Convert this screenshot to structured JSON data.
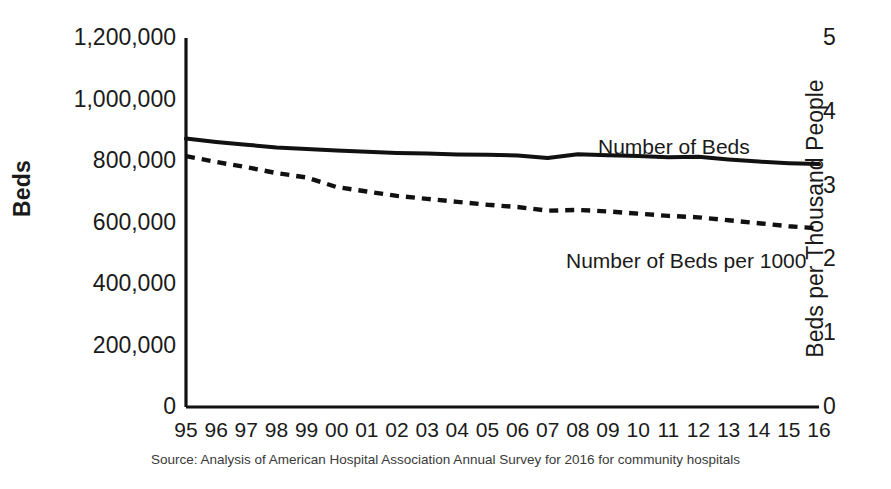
{
  "chart_data": {
    "type": "line",
    "title": "",
    "subtitle": "",
    "xlabel": "",
    "ylabel": "Beds",
    "y2label": "Beds per Thousand People",
    "grid": false,
    "legend_position": "inline-annotation",
    "x": [
      "95",
      "96",
      "97",
      "98",
      "99",
      "00",
      "01",
      "02",
      "03",
      "04",
      "05",
      "06",
      "07",
      "08",
      "09",
      "10",
      "11",
      "12",
      "13",
      "14",
      "15",
      "16"
    ],
    "x_full_years": [
      1995,
      1996,
      1997,
      1998,
      1999,
      2000,
      2001,
      2002,
      2003,
      2004,
      2005,
      2006,
      2007,
      2008,
      2009,
      2010,
      2011,
      2012,
      2013,
      2014,
      2015,
      2016
    ],
    "ylim": [
      0,
      1200000
    ],
    "yticks": [
      0,
      200000,
      400000,
      600000,
      800000,
      1000000,
      1200000
    ],
    "ytick_labels": [
      "0",
      "200,000",
      "400,000",
      "600,000",
      "800,000",
      "1,000,000",
      "1,200,000"
    ],
    "y2lim": [
      0,
      5
    ],
    "y2ticks": [
      0,
      1,
      2,
      3,
      4,
      5
    ],
    "y2tick_labels": [
      "0",
      "1",
      "2",
      "3",
      "4",
      "5"
    ],
    "series": [
      {
        "name": "Number of Beds",
        "axis": "left",
        "style": "solid",
        "color": "#111111",
        "values": [
          873000,
          862000,
          853000,
          844000,
          839000,
          834000,
          830000,
          826000,
          824000,
          821000,
          820000,
          818000,
          810000,
          822000,
          819000,
          816000,
          812000,
          814000,
          805000,
          798000,
          793000,
          790000
        ]
      },
      {
        "name": "Number of Beds per 1000",
        "axis": "right",
        "style": "dashed",
        "color": "#111111",
        "values": [
          3.4,
          3.32,
          3.25,
          3.17,
          3.11,
          2.98,
          2.92,
          2.86,
          2.82,
          2.78,
          2.74,
          2.71,
          2.66,
          2.67,
          2.65,
          2.62,
          2.59,
          2.57,
          2.53,
          2.49,
          2.45,
          2.42
        ]
      }
    ],
    "annotations": [
      {
        "name": "Number of Beds",
        "x_index": 16,
        "series": 0
      },
      {
        "name": "Number of Beds per 1000",
        "x_index": 15,
        "series": 1
      }
    ],
    "source": "Source: Analysis of American Hospital Association Annual Survey for 2016 for community hospitals"
  },
  "labels": {
    "y_axis_title": "Beds",
    "y2_axis_title": "Beds per Thousand People",
    "series_beds": "Number of Beds",
    "series_beds_per_1000": "Number of Beds per 1000",
    "source": "Source: Analysis of American Hospital Association Annual Survey for 2016 for community hospitals"
  },
  "colors": {
    "line": "#111111",
    "axis": "#111111",
    "text": "#1a1a1a",
    "source_text": "#3a3a3a",
    "background": "#ffffff"
  }
}
